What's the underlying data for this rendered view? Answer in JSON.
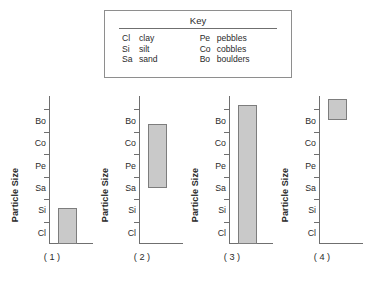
{
  "key": {
    "title": "Key",
    "left_column": [
      {
        "abbr": "Cl",
        "term": "clay"
      },
      {
        "abbr": "Si",
        "term": "silt"
      },
      {
        "abbr": "Sa",
        "term": "sand"
      }
    ],
    "right_column": [
      {
        "abbr": "Pe",
        "term": "pebbles"
      },
      {
        "abbr": "Co",
        "term": "cobbles"
      },
      {
        "abbr": "Bo",
        "term": "boulders"
      }
    ]
  },
  "chart_data": [
    {
      "type": "bar",
      "title": "( 1 )",
      "ylabel": "Particle Size",
      "xlabel": "",
      "categories": [
        "Cl",
        "Si",
        "Sa",
        "Pe",
        "Co",
        "Bo"
      ],
      "ylim": [
        0,
        6.6
      ],
      "grid": false,
      "legend": "none",
      "bars": [
        {
          "bottom": 0.0,
          "top": 1.6
        }
      ]
    },
    {
      "type": "bar",
      "title": "( 2 )",
      "ylabel": "Particle Size",
      "xlabel": "",
      "categories": [
        "Cl",
        "Si",
        "Sa",
        "Pe",
        "Co",
        "Bo"
      ],
      "ylim": [
        0,
        6.6
      ],
      "grid": false,
      "legend": "none",
      "bars": [
        {
          "bottom": 2.5,
          "top": 5.35
        }
      ]
    },
    {
      "type": "bar",
      "title": "( 3 )",
      "ylabel": "Particle Size",
      "xlabel": "",
      "categories": [
        "Cl",
        "Si",
        "Sa",
        "Pe",
        "Co",
        "Bo"
      ],
      "ylim": [
        0,
        6.6
      ],
      "grid": false,
      "legend": "none",
      "bars": [
        {
          "bottom": 0.0,
          "top": 6.2
        }
      ]
    },
    {
      "type": "bar",
      "title": "( 4 )",
      "ylabel": "Particle Size",
      "xlabel": "",
      "categories": [
        "Cl",
        "Si",
        "Sa",
        "Pe",
        "Co",
        "Bo"
      ],
      "ylim": [
        0,
        6.6
      ],
      "grid": false,
      "legend": "none",
      "bars": [
        {
          "bottom": 5.55,
          "top": 6.45
        }
      ]
    }
  ],
  "colors": {
    "bar_fill": "#c9c9c9",
    "bar_stroke": "#7d7d7d",
    "axis": "#6f6f6f",
    "text": "#2b2b2b",
    "background": "#ffffff"
  }
}
